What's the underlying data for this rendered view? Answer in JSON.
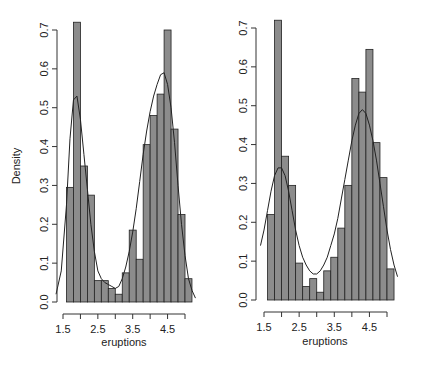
{
  "chart_data": [
    {
      "type": "bar",
      "subtype": "histogram_with_density",
      "title": "",
      "xlabel": "eruptions",
      "ylabel": "Density",
      "xlim": [
        1.5,
        5.0
      ],
      "ylim": [
        0,
        0.7
      ],
      "x_ticks": [
        "1.5",
        "2.5",
        "3.5",
        "4.5"
      ],
      "x_tick_values": [
        1.5,
        2.0,
        2.5,
        3.0,
        3.5,
        4.0,
        4.5,
        5.0
      ],
      "y_ticks": [
        "0.0",
        "0.1",
        "0.2",
        "0.3",
        "0.4",
        "0.5",
        "0.6",
        "0.7"
      ],
      "y_tick_values": [
        0,
        0.1,
        0.2,
        0.3,
        0.4,
        0.5,
        0.6,
        0.7
      ],
      "grid": false,
      "bar_color": "#8c8c8c",
      "bins": [
        1.6,
        1.8,
        2.0,
        2.2,
        2.4,
        2.6,
        2.8,
        3.0,
        3.2,
        3.4,
        3.6,
        3.8,
        4.0,
        4.2,
        4.4,
        4.6,
        4.8,
        5.0,
        5.2
      ],
      "values": [
        0.295,
        0.72,
        0.35,
        0.275,
        0.055,
        0.055,
        0.035,
        0.02,
        0.075,
        0.185,
        0.11,
        0.405,
        0.48,
        0.535,
        0.7,
        0.445,
        0.225,
        0.06
      ],
      "density_curve": {
        "x": [
          1.3,
          1.45,
          1.6,
          1.7,
          1.8,
          1.9,
          2.0,
          2.1,
          2.2,
          2.3,
          2.4,
          2.5,
          2.6,
          2.7,
          2.8,
          2.9,
          3.0,
          3.1,
          3.2,
          3.3,
          3.4,
          3.5,
          3.6,
          3.7,
          3.8,
          3.9,
          4.0,
          4.1,
          4.2,
          4.3,
          4.4,
          4.5,
          4.6,
          4.7,
          4.8,
          4.9,
          5.0,
          5.1,
          5.2,
          5.3
        ],
        "y": [
          0.02,
          0.08,
          0.25,
          0.42,
          0.52,
          0.53,
          0.47,
          0.38,
          0.29,
          0.2,
          0.13,
          0.08,
          0.06,
          0.05,
          0.045,
          0.04,
          0.035,
          0.04,
          0.06,
          0.09,
          0.13,
          0.18,
          0.24,
          0.31,
          0.38,
          0.44,
          0.49,
          0.53,
          0.56,
          0.585,
          0.59,
          0.56,
          0.5,
          0.41,
          0.3,
          0.2,
          0.12,
          0.06,
          0.03,
          0.01
        ]
      }
    },
    {
      "type": "bar",
      "subtype": "histogram_with_density",
      "title": "",
      "xlabel": "eruptions",
      "ylabel": "",
      "xlim": [
        1.5,
        5.0
      ],
      "ylim": [
        0,
        0.7
      ],
      "x_ticks": [
        "1.5",
        "2.5",
        "3.5",
        "4.5"
      ],
      "x_tick_values": [
        1.5,
        2.0,
        2.5,
        3.0,
        3.5,
        4.0,
        4.5,
        5.0
      ],
      "y_ticks": [
        "0.0",
        "0.1",
        "0.2",
        "0.3",
        "0.4",
        "0.5",
        "0.6",
        "0.7"
      ],
      "y_tick_values": [
        0,
        0.1,
        0.2,
        0.3,
        0.4,
        0.5,
        0.6,
        0.7
      ],
      "grid": false,
      "bar_color": "#8c8c8c",
      "bins": [
        1.6,
        1.8,
        2.0,
        2.2,
        2.4,
        2.6,
        2.8,
        3.0,
        3.2,
        3.4,
        3.6,
        3.8,
        4.0,
        4.2,
        4.4,
        4.6,
        4.8,
        5.0,
        5.2
      ],
      "values": [
        0.22,
        0.72,
        0.37,
        0.295,
        0.095,
        0.035,
        0.055,
        0.02,
        0.075,
        0.11,
        0.185,
        0.295,
        0.57,
        0.535,
        0.645,
        0.405,
        0.315,
        0.08
      ],
      "density_curve": {
        "x": [
          1.4,
          1.5,
          1.6,
          1.7,
          1.8,
          1.9,
          2.0,
          2.1,
          2.2,
          2.3,
          2.4,
          2.5,
          2.6,
          2.7,
          2.8,
          2.9,
          3.0,
          3.1,
          3.2,
          3.3,
          3.4,
          3.5,
          3.6,
          3.7,
          3.8,
          3.9,
          4.0,
          4.1,
          4.2,
          4.3,
          4.4,
          4.5,
          4.6,
          4.7,
          4.8,
          4.9,
          5.0,
          5.1,
          5.2,
          5.3
        ],
        "y": [
          0.14,
          0.18,
          0.23,
          0.28,
          0.32,
          0.34,
          0.34,
          0.32,
          0.28,
          0.23,
          0.18,
          0.14,
          0.11,
          0.09,
          0.075,
          0.067,
          0.067,
          0.075,
          0.09,
          0.11,
          0.14,
          0.17,
          0.21,
          0.26,
          0.31,
          0.36,
          0.41,
          0.45,
          0.48,
          0.49,
          0.48,
          0.45,
          0.41,
          0.36,
          0.3,
          0.24,
          0.18,
          0.13,
          0.09,
          0.06
        ]
      }
    }
  ],
  "panels": [
    {
      "frame": {
        "x0": 63,
        "x1": 185,
        "y0": 302,
        "y1": 30,
        "yaxis_x": 57,
        "xaxis_y": 314
      },
      "ylabel_pos": {
        "x": 20,
        "y": 166
      },
      "xlabel_pos": {
        "x": 124,
        "y": 346
      }
    },
    {
      "frame": {
        "x0": 264,
        "x1": 387,
        "y0": 300,
        "y1": 28,
        "yaxis_x": 256,
        "xaxis_y": 312
      },
      "ylabel_pos": null,
      "xlabel_pos": {
        "x": 325,
        "y": 345
      }
    }
  ]
}
